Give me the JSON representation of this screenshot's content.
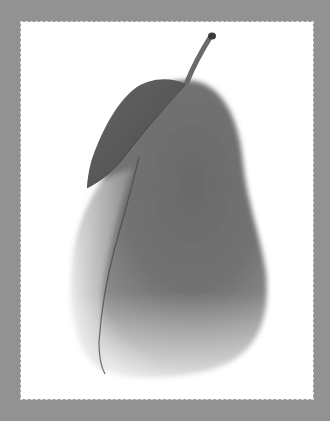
{
  "image": {
    "subject": "fabric pear with leaf and stem",
    "colors": {
      "frame": "#929292",
      "panel": "#ffffff",
      "pear_dark": "#5e5e5e",
      "pear_mid": "#7a7a7a",
      "pear_light": "#c8c8c8",
      "leaf": "#555555",
      "stem": "#6a6a6a"
    }
  }
}
